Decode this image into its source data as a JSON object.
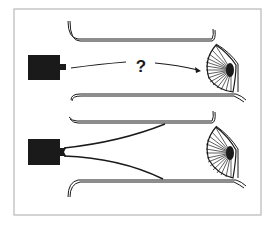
{
  "figure": {
    "panels": [
      {
        "id": "top",
        "label": "?"
      },
      {
        "id": "bottom",
        "label": ""
      }
    ],
    "colors": {
      "ink": "#1a1a1a",
      "frame": "#b8b8b8",
      "background": "#ffffff"
    }
  }
}
